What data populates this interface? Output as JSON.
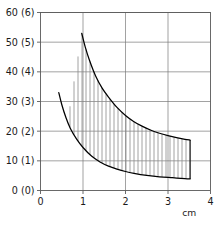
{
  "chart_data": {
    "type": "area",
    "title": "",
    "subtitle": "",
    "xlabel": "cm",
    "ylabel": "",
    "xlim": [
      0,
      4
    ],
    "ylim": [
      0,
      60
    ],
    "grid": true,
    "legend": "none",
    "annotations": [],
    "x_ticks": [
      "0",
      "1",
      "2",
      "3",
      "4"
    ],
    "x_tick_values": [
      0,
      1,
      2,
      3,
      4
    ],
    "y_ticks": [
      "0 (0)",
      "10 (1)",
      "20 (2)",
      "30 (3)",
      "40 (4)",
      "50 (5)",
      "60 (6)"
    ],
    "y_tick_values": [
      0,
      10,
      20,
      30,
      40,
      50,
      60
    ],
    "y_secondary_ticks": [
      "0",
      "1",
      "2",
      "3",
      "4",
      "5",
      "6"
    ],
    "y_secondary_lim": [
      0,
      6
    ],
    "fill_style": "vertical-hatch",
    "hatch_spacing_px": 4,
    "series": [
      {
        "name": "upper-bound",
        "x": [
          0.97,
          1.05,
          1.15,
          1.3,
          1.45,
          1.6,
          1.8,
          2.0,
          2.2,
          2.4,
          2.6,
          2.8,
          3.0,
          3.2,
          3.4,
          3.52
        ],
        "values": [
          53.0,
          48.5,
          44.0,
          38.5,
          34.5,
          31.5,
          28.0,
          25.3,
          23.2,
          21.6,
          20.3,
          19.3,
          18.5,
          17.8,
          17.2,
          17.0
        ]
      },
      {
        "name": "lower-bound",
        "x": [
          0.43,
          0.5,
          0.6,
          0.7,
          0.85,
          1.0,
          1.2,
          1.4,
          1.6,
          1.8,
          2.0,
          2.2,
          2.5,
          2.8,
          3.1,
          3.4,
          3.52
        ],
        "values": [
          33.0,
          29.0,
          24.5,
          21.0,
          17.3,
          14.5,
          11.6,
          9.6,
          8.2,
          7.2,
          6.4,
          5.8,
          5.1,
          4.6,
          4.3,
          4.0,
          3.9
        ]
      }
    ],
    "band_fill_x_start": 0.6,
    "band_fill_x_end": 3.52,
    "colors": {
      "curve": "#000000",
      "grid": "#7a7a7a",
      "frame": "#5a5a5a",
      "hatch": "#8c8c8c",
      "text": "#1a1a1a",
      "background": "#ffffff"
    }
  }
}
